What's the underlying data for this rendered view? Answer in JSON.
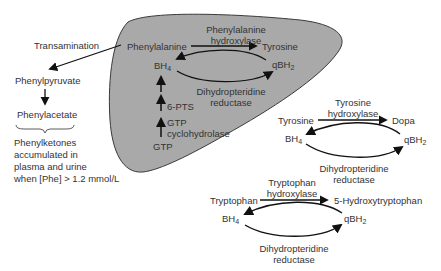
{
  "colors": {
    "liver_fill": "#a9a9a9",
    "liver_stroke": "#3a3a3a",
    "arrow": "#111111",
    "text": "#333333"
  },
  "liver": {
    "phenylalanine": "Phenylalanine",
    "enzyme_line1": "Phenylalanine",
    "enzyme_line2": "hydroxylase",
    "tyrosine": "Tyrosine",
    "bh4": "BH",
    "bh4_sub": "4",
    "qbh2": "qBH",
    "qbh2_sub": "2",
    "reductase_line1": "Dihydropteridine",
    "reductase_line2": "reductase",
    "pts": "6-PTS",
    "gtp_cyclo_line1": "GTP",
    "gtp_cyclo_line2": "cyclohydrolase",
    "gtp": "GTP"
  },
  "side_pathway": {
    "transamination": "Transamination",
    "phenylpyruvate": "Phenylpyruvate",
    "phenylacetate": "Phenylacetate",
    "note_lines": [
      "Phenylketones",
      "accumulated in",
      "plasma and urine",
      "when [Phe] > 1.2 mmol/L"
    ]
  },
  "tyrosine_cycle": {
    "enzyme_line1": "Tyrosine",
    "enzyme_line2": "hydroxylase",
    "substrate": "Tyrosine",
    "product": "Dopa",
    "bh4": "BH",
    "bh4_sub": "4",
    "qbh2": "qBH",
    "qbh2_sub": "2",
    "reductase_line1": "Dihydropteridine",
    "reductase_line2": "reductase"
  },
  "tryptophan_cycle": {
    "enzyme_line1": "Tryptophan",
    "enzyme_line2": "hydroxylase",
    "substrate": "Tryptophan",
    "product": "5-Hydroxytryptophan",
    "bh4": "BH",
    "bh4_sub": "4",
    "qbh2": "qBH",
    "qbh2_sub": "2",
    "reductase_line1": "Dihydropteridine",
    "reductase_line2": "reductase"
  }
}
